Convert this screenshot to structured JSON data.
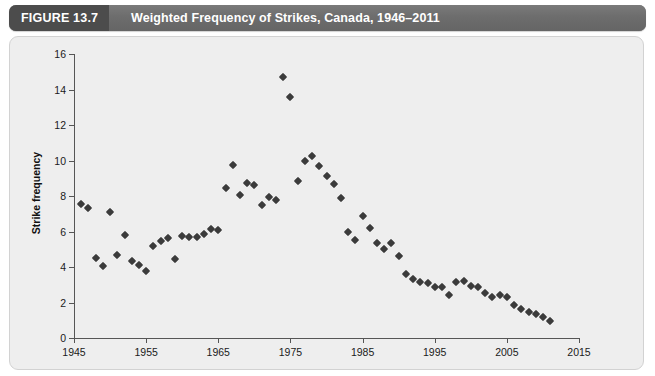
{
  "figure": {
    "label": "FIGURE 13.7",
    "title": "Weighted Frequency of Strikes, Canada, 1946–2011",
    "header_bg": "#6d6d6d",
    "label_bg": "#4c4c4c",
    "panel_bg": "#eeeeee"
  },
  "chart_data": {
    "type": "scatter",
    "title": "Weighted Frequency of Strikes, Canada, 1946–2011",
    "xlabel": "",
    "ylabel": "Strike frequency",
    "xlim": [
      1945,
      2015
    ],
    "ylim": [
      0,
      16
    ],
    "xticks": [
      1945,
      1955,
      1965,
      1975,
      1985,
      1995,
      2005,
      2015
    ],
    "yticks": [
      0,
      2,
      4,
      6,
      8,
      10,
      12,
      14,
      16
    ],
    "grid": false,
    "legend": null,
    "marker": "diamond",
    "marker_color": "#3b3b3b",
    "series": [
      {
        "name": "Weighted strike frequency",
        "points": [
          [
            1946,
            7.55
          ],
          [
            1947,
            7.35
          ],
          [
            1948,
            4.5
          ],
          [
            1949,
            4.05
          ],
          [
            1950,
            7.1
          ],
          [
            1951,
            4.65
          ],
          [
            1952,
            5.8
          ],
          [
            1953,
            4.35
          ],
          [
            1954,
            4.1
          ],
          [
            1955,
            3.75
          ],
          [
            1956,
            5.2
          ],
          [
            1957,
            5.45
          ],
          [
            1958,
            5.65
          ],
          [
            1959,
            4.45
          ],
          [
            1960,
            5.75
          ],
          [
            1961,
            5.7
          ],
          [
            1962,
            5.7
          ],
          [
            1963,
            5.85
          ],
          [
            1964,
            6.15
          ],
          [
            1965,
            6.1
          ],
          [
            1966,
            8.45
          ],
          [
            1967,
            9.75
          ],
          [
            1968,
            8.05
          ],
          [
            1969,
            8.75
          ],
          [
            1970,
            8.6
          ],
          [
            1971,
            7.5
          ],
          [
            1972,
            7.95
          ],
          [
            1973,
            7.8
          ],
          [
            1974,
            14.7
          ],
          [
            1975,
            13.55
          ],
          [
            1976,
            8.85
          ],
          [
            1977,
            9.95
          ],
          [
            1978,
            10.25
          ],
          [
            1979,
            9.7
          ],
          [
            1980,
            9.1
          ],
          [
            1981,
            8.7
          ],
          [
            1982,
            7.9
          ],
          [
            1983,
            6.0
          ],
          [
            1984,
            5.5
          ],
          [
            1985,
            6.85
          ],
          [
            1986,
            6.2
          ],
          [
            1987,
            5.35
          ],
          [
            1988,
            5.0
          ],
          [
            1989,
            5.35
          ],
          [
            1990,
            4.6
          ],
          [
            1991,
            3.6
          ],
          [
            1992,
            3.35
          ],
          [
            1993,
            3.15
          ],
          [
            1994,
            3.1
          ],
          [
            1995,
            2.85
          ],
          [
            1996,
            2.9
          ],
          [
            1997,
            2.4
          ],
          [
            1998,
            3.15
          ],
          [
            1999,
            3.2
          ],
          [
            2000,
            2.95
          ],
          [
            2001,
            2.85
          ],
          [
            2002,
            2.55
          ],
          [
            2003,
            2.3
          ],
          [
            2004,
            2.4
          ],
          [
            2005,
            2.3
          ],
          [
            2006,
            1.85
          ],
          [
            2007,
            1.65
          ],
          [
            2008,
            1.45
          ],
          [
            2009,
            1.35
          ],
          [
            2010,
            1.2
          ],
          [
            2011,
            0.95
          ]
        ]
      }
    ]
  }
}
